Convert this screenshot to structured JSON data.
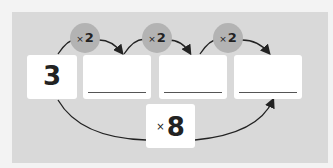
{
  "diagram": {
    "start_value": "3",
    "blanks": [
      "",
      "",
      ""
    ],
    "step_operations": [
      {
        "symbol": "×",
        "value": "2"
      },
      {
        "symbol": "×",
        "value": "2"
      },
      {
        "symbol": "×",
        "value": "2"
      }
    ],
    "combined_operation": {
      "symbol": "×",
      "value": "8"
    }
  }
}
